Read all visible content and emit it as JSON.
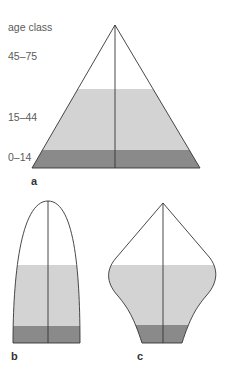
{
  "axis_title": "age class",
  "age_classes": [
    "45–75",
    "15–44",
    "0–14"
  ],
  "figures": [
    {
      "label": "a",
      "shape": "expanding-pyramid"
    },
    {
      "label": "b",
      "shape": "stable-bell"
    },
    {
      "label": "c",
      "shape": "declining-urn"
    }
  ],
  "colors": {
    "outline": "#333333",
    "band_15_44": "#d3d3d3",
    "band_0_14": "#8a8a8a",
    "band_45_75": "#ffffff"
  }
}
